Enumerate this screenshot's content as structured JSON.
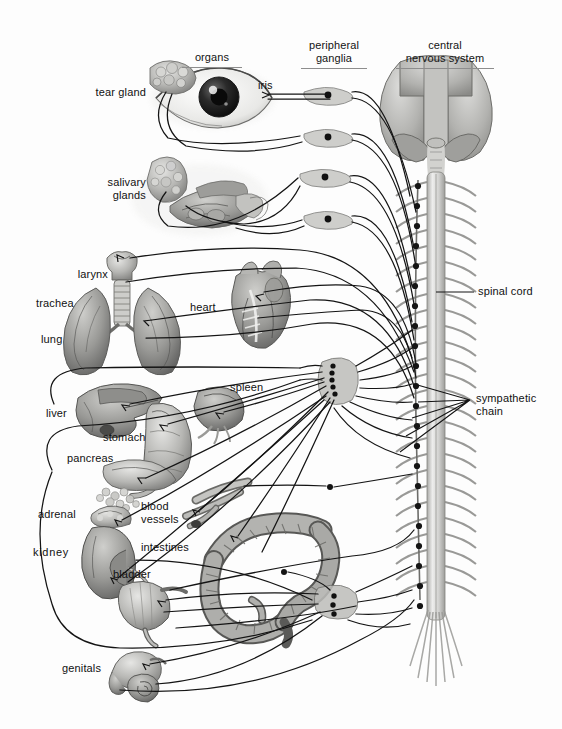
{
  "figure": {
    "background_color": "#fdfdfd",
    "ink_color": "#111111",
    "tissue_light": "#d8d8d6",
    "tissue_mid": "#a8a8a6",
    "tissue_dark": "#6f6f6e",
    "width": 562,
    "height": 729
  },
  "columns": [
    {
      "id": "organs",
      "label": "organs",
      "x": 178,
      "y": 38,
      "width": 68,
      "rule_width": 60
    },
    {
      "id": "ganglia",
      "label": "peripheral\nganglia",
      "x": 296,
      "y": 26,
      "width": 76,
      "rule_width": 66
    },
    {
      "id": "cns",
      "label": "central\nnervous  system",
      "x": 390,
      "y": 26,
      "width": 110,
      "rule_width": 98
    }
  ],
  "organ_labels": [
    {
      "id": "tear-gland",
      "text": "tear gland",
      "x": 84,
      "y": 86,
      "align": "end",
      "width": 62
    },
    {
      "id": "iris",
      "text": "iris",
      "x": 258,
      "y": 79,
      "align": "right",
      "width": 30
    },
    {
      "id": "salivary",
      "text": "salivary\nglands",
      "x": 88,
      "y": 176,
      "align": "end",
      "width": 58
    },
    {
      "id": "larynx",
      "text": "larynx",
      "x": 64,
      "y": 268,
      "align": "end",
      "width": 44
    },
    {
      "id": "trachea",
      "text": "trachea",
      "x": 36,
      "y": 297,
      "align": "right",
      "width": 52
    },
    {
      "id": "lung",
      "text": "lung",
      "x": 41,
      "y": 333,
      "align": "right",
      "width": 34
    },
    {
      "id": "heart",
      "text": "heart",
      "x": 190,
      "y": 301,
      "align": "right",
      "width": 38
    },
    {
      "id": "spleen",
      "text": "spleen",
      "x": 230,
      "y": 381,
      "align": "right",
      "width": 44
    },
    {
      "id": "liver",
      "text": "liver",
      "x": 46,
      "y": 407,
      "align": "right",
      "width": 32
    },
    {
      "id": "stomach",
      "text": "stomach",
      "x": 103,
      "y": 431,
      "align": "right",
      "width": 52
    },
    {
      "id": "pancreas",
      "text": "pancreas",
      "x": 67,
      "y": 452,
      "align": "right",
      "width": 56
    },
    {
      "id": "adrenal",
      "text": "adrenal",
      "x": 38,
      "y": 508,
      "align": "right",
      "width": 50
    },
    {
      "id": "blood-vessels",
      "text": "blood\nvessels",
      "x": 141,
      "y": 500,
      "align": "right",
      "width": 50
    },
    {
      "id": "kidney",
      "text": "kidney",
      "x": 33,
      "y": 546,
      "align": "right",
      "width": 46
    },
    {
      "id": "intestines",
      "text": "intestines",
      "x": 141,
      "y": 541,
      "align": "right",
      "width": 62
    },
    {
      "id": "bladder",
      "text": "bladder",
      "x": 113,
      "y": 568,
      "align": "right",
      "width": 50
    },
    {
      "id": "genitals",
      "text": "genitals",
      "x": 62,
      "y": 662,
      "align": "right",
      "width": 52
    }
  ],
  "cns_labels": [
    {
      "id": "spinal-cord",
      "text": "spinal cord",
      "x": 478,
      "y": 285,
      "width": 76
    },
    {
      "id": "sympathetic-chain",
      "text": "sympathetic\nchain",
      "x": 476,
      "y": 392,
      "width": 80
    }
  ],
  "structures": {
    "brain": {
      "label": "brain"
    },
    "spinal_cord": {
      "label": "spinal cord",
      "segments": 26
    },
    "chain": {
      "label": "sympathetic chain ganglia",
      "count": 22
    },
    "cranial_ganglia": {
      "label": "cranial peripheral ganglia",
      "count": 4
    },
    "celiac_ganglion": {
      "label": "celiac ganglion"
    },
    "pelvic_ganglion": {
      "label": "pelvic ganglion"
    }
  }
}
